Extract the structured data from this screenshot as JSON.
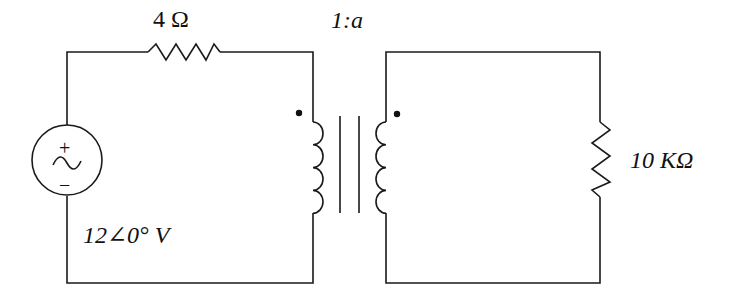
{
  "diagram": {
    "type": "circuit-schematic",
    "components": {
      "series_resistor": {
        "label": "4 Ω"
      },
      "source": {
        "label": "12∠0° V",
        "plus": "+",
        "minus": "−",
        "symbol": "~"
      },
      "transformer": {
        "label": "1:a"
      },
      "load_resistor": {
        "label": "10 KΩ"
      }
    },
    "colors": {
      "stroke": "#1a1a1a",
      "background": "#ffffff"
    }
  }
}
